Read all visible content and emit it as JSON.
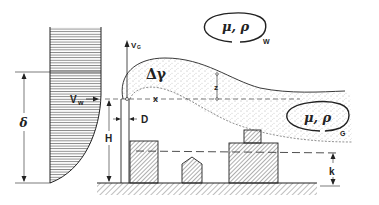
{
  "diagram": {
    "labels": {
      "wind_velocity": "V",
      "wind_velocity_sub": "w",
      "boundary_layer_height": "δ",
      "stack_exit_velocity": "V",
      "stack_exit_velocity_sub": "G",
      "density_difference": "Δγ",
      "stack_height": "H",
      "stack_diameter": "D",
      "downwind_distance": "x",
      "plume_rise": "z",
      "roughness_height": "k",
      "wind_properties": "μ, ρ",
      "wind_properties_sub": "W",
      "gas_properties": "μ, ρ",
      "gas_properties_sub": "G"
    },
    "elements": [
      "velocity-profile",
      "stack",
      "plume",
      "building-left",
      "building-small-pointed",
      "building-right-with-rooftop",
      "ground",
      "roughness-dashed-line"
    ],
    "colors": {
      "ink": "#222222",
      "background": "#ffffff"
    }
  }
}
